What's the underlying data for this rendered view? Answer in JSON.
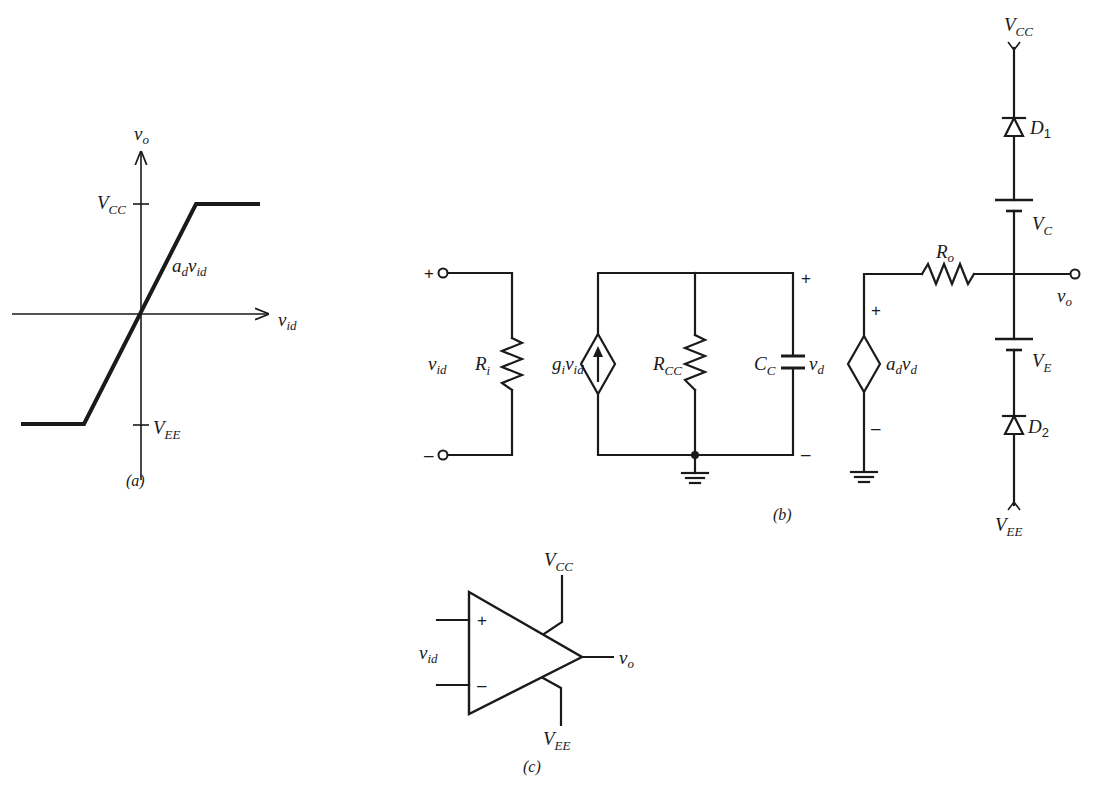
{
  "figure_a": {
    "caption": "(a)",
    "y_axis": {
      "main": "v",
      "sub": "o"
    },
    "x_axis": {
      "main": "v",
      "sub": "id"
    },
    "vcc": {
      "main": "V",
      "sub": "CC"
    },
    "vee": {
      "main": "V",
      "sub": "EE"
    },
    "slope": {
      "a": "a",
      "a_sub": "d",
      "v": "v",
      "v_sub": "id"
    }
  },
  "figure_b": {
    "caption": "(b)",
    "input_plus": "+",
    "input_minus": "–",
    "vid": {
      "main": "v",
      "sub": "id"
    },
    "ri": {
      "main": "R",
      "sub": "i"
    },
    "gi_vid": {
      "g": "g",
      "g_sub": "i",
      "v": "v",
      "v_sub": "id"
    },
    "rcc": {
      "main": "R",
      "sub": "CC"
    },
    "cc": {
      "main": "C",
      "sub": "C"
    },
    "vd": {
      "main": "v",
      "sub": "d"
    },
    "vd_plus": "+",
    "vd_minus": "–",
    "ad_vd": {
      "a": "a",
      "a_sub": "d",
      "v": "v",
      "v_sub": "d"
    },
    "src_plus": "+",
    "src_minus": "–",
    "ro": {
      "main": "R",
      "sub": "o"
    },
    "vo": {
      "main": "v",
      "sub": "o"
    },
    "vcc": {
      "main": "V",
      "sub": "CC"
    },
    "vee": {
      "main": "V",
      "sub": "EE"
    },
    "d1": {
      "main": "D",
      "sub": "1"
    },
    "d2": {
      "main": "D",
      "sub": "2"
    },
    "vc": {
      "main": "V",
      "sub": "C"
    },
    "ve": {
      "main": "V",
      "sub": "E"
    }
  },
  "figure_c": {
    "caption": "(c)",
    "plus": "+",
    "minus": "–",
    "vid": {
      "main": "v",
      "sub": "id"
    },
    "vo": {
      "main": "v",
      "sub": "o"
    },
    "vcc": {
      "main": "V",
      "sub": "CC"
    },
    "vee": {
      "main": "V",
      "sub": "EE"
    }
  }
}
